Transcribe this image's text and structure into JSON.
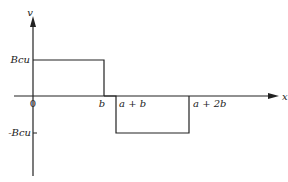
{
  "diagram": {
    "type": "piecewise-step-plot",
    "axes": {
      "y_label": "v",
      "x_label": "x",
      "origin_label": "0"
    },
    "y_ticks": [
      {
        "label": "Bcu",
        "value": "Bcu"
      },
      {
        "label": "-Bcu",
        "value": "-Bcu"
      }
    ],
    "x_ticks": [
      {
        "label": "b"
      },
      {
        "label": "a + b"
      },
      {
        "label": "a + 2b"
      }
    ],
    "segments": [
      {
        "from": "0",
        "to": "b",
        "value": "Bcu"
      },
      {
        "from": "b",
        "to": "a + b",
        "value": "0"
      },
      {
        "from": "a + b",
        "to": "a + 2b",
        "value": "-Bcu"
      }
    ],
    "colors": {
      "line": "#222222",
      "background": "#ffffff"
    }
  }
}
